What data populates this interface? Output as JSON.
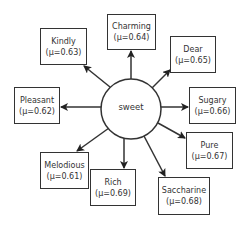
{
  "diagram": {
    "center": {
      "label": "sweet",
      "cx": 131,
      "cy": 109,
      "r": 30
    },
    "nodes": [
      {
        "id": "kindly",
        "word": "Kindly",
        "score": "(μ=0.63)",
        "x": 40,
        "y": 28,
        "w": 47,
        "h": 37
      },
      {
        "id": "charming",
        "word": "Charming",
        "score": "(μ=0.64)",
        "x": 107,
        "y": 14,
        "w": 49,
        "h": 36
      },
      {
        "id": "dear",
        "word": "Dear",
        "score": "(μ=0.65)",
        "x": 170,
        "y": 36,
        "w": 46,
        "h": 37
      },
      {
        "id": "pleasant",
        "word": "Pleasant",
        "score": "(μ=0.62)",
        "x": 14,
        "y": 87,
        "w": 46,
        "h": 37
      },
      {
        "id": "sugary",
        "word": "Sugary",
        "score": "(μ=0.66)",
        "x": 189,
        "y": 87,
        "w": 47,
        "h": 37
      },
      {
        "id": "pure",
        "word": "Pure",
        "score": "(μ=0.67)",
        "x": 186,
        "y": 132,
        "w": 47,
        "h": 37
      },
      {
        "id": "melodious",
        "word": "Melodious",
        "score": "(μ=0.61)",
        "x": 40,
        "y": 152,
        "w": 49,
        "h": 37
      },
      {
        "id": "rich",
        "word": "Rich",
        "score": "(μ=0.69)",
        "x": 90,
        "y": 169,
        "w": 46,
        "h": 37
      },
      {
        "id": "saccharine",
        "word": "Saccharine",
        "score": "(μ=0.68)",
        "x": 158,
        "y": 177,
        "w": 52,
        "h": 38
      }
    ],
    "edges": [
      {
        "to": "kindly",
        "x1": 110,
        "y1": 87,
        "x2": 84,
        "y2": 66
      },
      {
        "to": "charming",
        "x1": 131,
        "y1": 79,
        "x2": 131,
        "y2": 51
      },
      {
        "to": "dear",
        "x1": 152,
        "y1": 88,
        "x2": 170,
        "y2": 70
      },
      {
        "to": "pleasant",
        "x1": 101,
        "y1": 107,
        "x2": 61,
        "y2": 107
      },
      {
        "to": "sugary",
        "x1": 161,
        "y1": 107,
        "x2": 188,
        "y2": 107
      },
      {
        "to": "pure",
        "x1": 158,
        "y1": 123,
        "x2": 185,
        "y2": 138
      },
      {
        "to": "melodious",
        "x1": 109,
        "y1": 128,
        "x2": 77,
        "y2": 151
      },
      {
        "to": "rich",
        "x1": 124,
        "y1": 138,
        "x2": 124,
        "y2": 168
      },
      {
        "to": "saccharine",
        "x1": 144,
        "y1": 136,
        "x2": 165,
        "y2": 176
      }
    ],
    "colors": {
      "stroke": "#333333",
      "text": "#333333",
      "background": "#ffffff"
    }
  }
}
